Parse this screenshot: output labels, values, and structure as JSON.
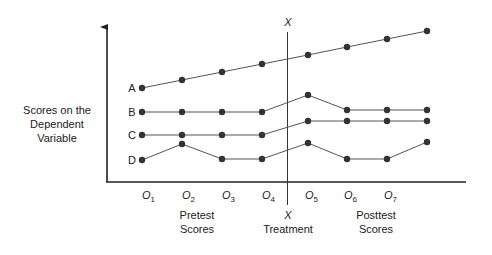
{
  "y_axis_label": [
    "Scores on the",
    "Dependent",
    "Variable"
  ],
  "treatment": {
    "top_label": "X",
    "bottom_label": "X",
    "caption": "Treatment"
  },
  "pretest_caption": [
    "Pretest",
    "Scores"
  ],
  "posttest_caption": [
    "Posttest",
    "Scores"
  ],
  "observations": [
    {
      "base": "O",
      "sub": "1"
    },
    {
      "base": "O",
      "sub": "2"
    },
    {
      "base": "O",
      "sub": "3"
    },
    {
      "base": "O",
      "sub": "4"
    },
    {
      "base": "O",
      "sub": "5"
    },
    {
      "base": "O",
      "sub": "6"
    },
    {
      "base": "O",
      "sub": "7"
    }
  ],
  "colors": {
    "line": "#555555",
    "point": "#333333",
    "axis": "#222222"
  },
  "chart_data": {
    "type": "line",
    "title": "",
    "xlabel": "",
    "ylabel": "Scores on the Dependent Variable",
    "categories": [
      "O1",
      "O2",
      "O3",
      "O4",
      "O5",
      "O6",
      "O7",
      "O8"
    ],
    "treatment_between": [
      "O4",
      "O5"
    ],
    "point_x": [
      142,
      182,
      222,
      262,
      308,
      347,
      387,
      427
    ],
    "series": [
      {
        "name": "A",
        "values": [
          88,
          80,
          72,
          64,
          55,
          47,
          39,
          31
        ]
      },
      {
        "name": "B",
        "values": [
          112,
          112,
          112,
          112,
          95,
          110,
          110,
          110
        ]
      },
      {
        "name": "C",
        "values": [
          135,
          135,
          135,
          135,
          121,
          121,
          121,
          121
        ]
      },
      {
        "name": "D",
        "values": [
          160,
          144,
          159,
          159,
          143,
          159,
          159,
          142
        ]
      }
    ],
    "note": "values are pixel y-positions (smaller = higher score)"
  }
}
